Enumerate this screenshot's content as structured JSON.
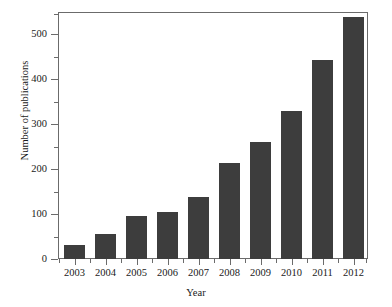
{
  "chart_data": {
    "type": "bar",
    "title": "",
    "subtitle": "",
    "xlabel": "Year",
    "ylabel": "Number of publications",
    "categories": [
      "2003",
      "2004",
      "2005",
      "2006",
      "2007",
      "2008",
      "2009",
      "2010",
      "2011",
      "2012"
    ],
    "values": [
      31,
      55,
      96,
      104,
      138,
      214,
      260,
      330,
      443,
      537
    ],
    "series": [
      {
        "name": "Number of publications",
        "values": [
          31,
          55,
          96,
          104,
          138,
          214,
          260,
          330,
          443,
          537
        ]
      }
    ],
    "ylim": [
      0,
      549
    ],
    "xlim_categories": 10,
    "ytick_labels": [
      "0",
      "100",
      "200",
      "300",
      "400",
      "500"
    ],
    "ytick_values": [
      0,
      100,
      200,
      300,
      400,
      500
    ],
    "yminor_tick_values": [
      50,
      150,
      250,
      350,
      450,
      550
    ],
    "grid": false,
    "legend": null,
    "legend_position": "none",
    "bar_color": "#3d3d3d",
    "axis_color": "#6b6b6b",
    "background_color": "#ffffff",
    "text_color": "#1a1a1a"
  }
}
